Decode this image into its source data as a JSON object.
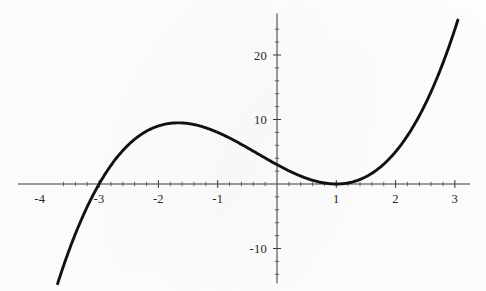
{
  "chart_data": {
    "type": "line",
    "title": "",
    "subtitle": "",
    "xlabel": "",
    "ylabel": "",
    "expression": "(x + 3)(x - 1)^2",
    "expanded": "x^3 + x^2 - 5x + 3",
    "xlim": [
      -3.7,
      3.05
    ],
    "ylim": [
      -14.5,
      25.5
    ],
    "grid": false,
    "legend": null,
    "axes_style": "cross-through-origin",
    "x_tick_labels": [
      "-4",
      "-3",
      "-2",
      "-1",
      "1",
      "2",
      "3"
    ],
    "x_tick_values": [
      -4,
      -3,
      -2,
      -1,
      1,
      2,
      3
    ],
    "y_tick_labels": [
      "20",
      "10",
      "-10"
    ],
    "y_tick_values": [
      20,
      10,
      -10
    ],
    "x_minor_tick_step": 0.2,
    "y_minor_tick_step": 2,
    "roots": [
      -3,
      1
    ],
    "double_root": 1,
    "local_maximum": {
      "x": -1.7208,
      "y": 9.5438
    },
    "local_minimum": {
      "x": 1,
      "y": 0
    },
    "y_intercept": 3,
    "series": [
      {
        "name": "f(x) = (x+3)(x-1)^2",
        "color": "#111111",
        "x": [
          -3.68,
          -3.5,
          -3.3,
          -3.1,
          -3.0,
          -2.9,
          -2.7,
          -2.5,
          -2.3,
          -2.1,
          -1.9,
          -1.72,
          -1.5,
          -1.3,
          -1.1,
          -0.9,
          -0.7,
          -0.5,
          -0.3,
          -0.1,
          0.0,
          0.2,
          0.4,
          0.6,
          0.8,
          1.0,
          1.2,
          1.4,
          1.6,
          1.8,
          2.0,
          2.2,
          2.4,
          2.6,
          2.8,
          3.0
        ],
        "y": [
          -14.44,
          -10.13,
          -6.09,
          -2.69,
          -1.21,
          0.15,
          2.44,
          4.38,
          5.96,
          7.21,
          8.12,
          9.54,
          9.38,
          9.13,
          8.41,
          7.56,
          6.62,
          5.63,
          4.56,
          3.51,
          3.0,
          2.05,
          1.22,
          0.58,
          0.15,
          0.0,
          0.17,
          0.7,
          1.66,
          3.07,
          5.0,
          7.49,
          10.58,
          14.34,
          18.81,
          24.0
        ]
      }
    ]
  },
  "axis": {
    "x_axis_name": "x-axis",
    "y_axis_name": "y-axis"
  }
}
